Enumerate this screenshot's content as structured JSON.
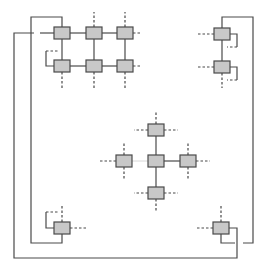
{
  "diagram": {
    "title": "",
    "colors": {
      "node_fill": "#c8c8c8",
      "node_stroke": "#4a4a4a",
      "wire": "#4a4a4a",
      "background": "#ffffff"
    },
    "node_size": {
      "w": 16,
      "h": 12
    },
    "nodes": [
      {
        "id": "tl-r0c0",
        "x": 54,
        "y": 27
      },
      {
        "id": "tl-r0c1",
        "x": 86,
        "y": 27
      },
      {
        "id": "tl-r0c2",
        "x": 117,
        "y": 27
      },
      {
        "id": "tl-r1c0",
        "x": 54,
        "y": 60
      },
      {
        "id": "tl-r1c1",
        "x": 86,
        "y": 60
      },
      {
        "id": "tl-r1c2",
        "x": 117,
        "y": 60
      },
      {
        "id": "tr-top",
        "x": 214,
        "y": 28
      },
      {
        "id": "tr-bottom",
        "x": 214,
        "y": 61
      },
      {
        "id": "c-top",
        "x": 148,
        "y": 124
      },
      {
        "id": "c-center",
        "x": 148,
        "y": 155
      },
      {
        "id": "c-left",
        "x": 116,
        "y": 155
      },
      {
        "id": "c-right",
        "x": 180,
        "y": 155
      },
      {
        "id": "c-bottom",
        "x": 148,
        "y": 187
      },
      {
        "id": "bl",
        "x": 54,
        "y": 222
      },
      {
        "id": "br",
        "x": 213,
        "y": 222
      }
    ],
    "solid_wires": [
      "M70 33 L86 33",
      "M102 33 L117 33",
      "M70 66 L86 66",
      "M102 66 L117 66",
      "M62 39 L62 60",
      "M94 39 L94 60",
      "M125 39 L125 60",
      "M62 27 L62 17 L31 17 L31 243 L62 243 L62 234",
      "M54 33 L40 33",
      "M34 33 L14 33 L14 258 L237 258 L237 228 L229 228",
      "M54 66 L46 66 L46 51",
      "M222 28 L222 17 L253 17 L253 243 L243 243",
      "M222 40 L222 61",
      "M230 34 L237 34 L237 47",
      "M230 67 L237 67 L237 80",
      "M156 136 L156 155",
      "M164 161 L180 161",
      "M156 167 L156 187",
      "M54 228 L46 228 L46 212",
      "M221 234 L221 243 L235 243"
    ],
    "dashed_wires": [
      "M46 51 L58 51",
      "M62 72 L62 88",
      "M94 72 L94 88",
      "M125 72 L125 88",
      "M94 27 L94 12",
      "M125 27 L125 12",
      "M133 33 L140 33",
      "M133 66 L140 66",
      "M214 34 L198 34",
      "M214 67 L198 67",
      "M237 47 L227 47",
      "M237 80 L227 80",
      "M222 73 L222 88",
      "M156 124 L156 112",
      "M148 130 L134 130",
      "M164 130 L178 130",
      "M116 161 L100 161",
      "M124 155 L124 143",
      "M124 167 L124 180",
      "M196 161 L210 161",
      "M188 155 L188 143",
      "M188 167 L188 180",
      "M148 193 L134 193",
      "M164 193 L178 193",
      "M156 199 L156 211",
      "M46 212 L58 212",
      "M62 222 L62 205",
      "M70 228 L86 228",
      "M213 228 L197 228",
      "M221 222 L221 205"
    ],
    "faint_wires": [
      "M132 161 L148 161"
    ]
  }
}
